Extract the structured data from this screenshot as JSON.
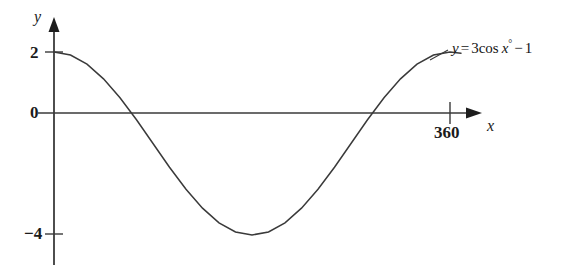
{
  "figure": {
    "title": "",
    "background_color": "#ffffff",
    "line_color": "#3a3a3a",
    "text_color": "#1b1b1b",
    "width": 567,
    "height": 278
  },
  "axes": {
    "y_axis_name": "y",
    "x_axis_name": "x",
    "y_ticks": [
      {
        "label": "2",
        "value": 2
      },
      {
        "label": "0",
        "value": 0
      },
      {
        "label": "−4",
        "value": -4
      }
    ],
    "x_ticks": [
      {
        "label": "360",
        "value": 360
      }
    ]
  },
  "equation": {
    "lhs": "y",
    "equals": "=",
    "coefficient": "3",
    "function": "cos",
    "variable": "x",
    "degree": "°",
    "minus": "−",
    "constant": "1",
    "full_text": "y = 3cos x° − 1"
  },
  "chart_data": {
    "type": "line",
    "title": "",
    "xlabel": "x",
    "ylabel": "y",
    "xlim": [
      0,
      400
    ],
    "ylim": [
      -4.6,
      2.6
    ],
    "grid": false,
    "legend": null,
    "annotations": [
      {
        "text": "y = 3cos x° − 1",
        "x": 370,
        "y": 2.4
      }
    ],
    "series": [
      {
        "name": "y = 3cos x° − 1",
        "formula": "3*cos(x_degrees) - 1",
        "color": "#3a3a3a",
        "x": [
          0,
          15,
          30,
          45,
          60,
          75,
          90,
          105,
          120,
          135,
          150,
          165,
          180,
          195,
          210,
          225,
          240,
          255,
          270,
          285,
          300,
          315,
          330,
          345,
          360,
          370
        ],
        "y": [
          2.0,
          1.9,
          1.6,
          1.12,
          0.5,
          -0.22,
          -1.0,
          -1.78,
          -2.5,
          -3.12,
          -3.6,
          -3.9,
          -4.0,
          -3.9,
          -3.6,
          -3.12,
          -2.5,
          -1.78,
          -1.0,
          -0.22,
          0.5,
          1.12,
          1.6,
          1.9,
          2.0,
          1.96
        ],
        "key_points": {
          "y_intercept": 2,
          "minimum": {
            "x": 180,
            "y": -4
          },
          "zero_crossings": [
            70.5,
            289.5
          ],
          "maximum": {
            "x": 0,
            "y": 2
          },
          "period": 360,
          "amplitude": 3,
          "vertical_shift": -1
        }
      }
    ]
  }
}
